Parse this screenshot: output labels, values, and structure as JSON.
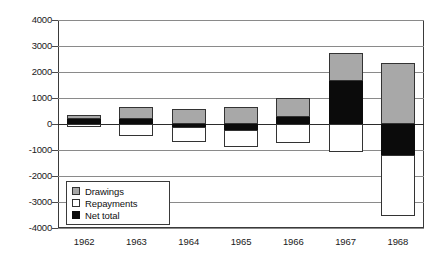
{
  "chart_data": {
    "type": "bar",
    "title": "",
    "subtitle": "",
    "xlabel": "",
    "ylabel": "",
    "categories": [
      "1962",
      "1963",
      "1964",
      "1965",
      "1966",
      "1967",
      "1968"
    ],
    "series": [
      {
        "name": "Drawings",
        "color": "#a8a8a8",
        "values": [
          330,
          650,
          580,
          640,
          1000,
          2750,
          2350
        ]
      },
      {
        "name": "Repayments",
        "color": "#ffffff",
        "values": [
          -130,
          -450,
          -680,
          -870,
          -720,
          -1080,
          -3550
        ]
      },
      {
        "name": "Net total",
        "color": "#0b0b0b",
        "values": [
          200,
          200,
          -100,
          -230,
          280,
          1650,
          -1200
        ]
      }
    ],
    "ylim": [
      -4000,
      4000
    ],
    "ytick_labels": [
      "4000",
      "3000",
      "2000",
      "1000",
      "0",
      "-1000",
      "-2000",
      "-3000",
      "-4000"
    ],
    "ytick_values": [
      4000,
      3000,
      2000,
      1000,
      0,
      -1000,
      -2000,
      -3000,
      -4000
    ],
    "grid": true,
    "legend_position": "inside-lower-left",
    "legend_entries": [
      "Drawings",
      "Repayments",
      "Net total"
    ]
  }
}
